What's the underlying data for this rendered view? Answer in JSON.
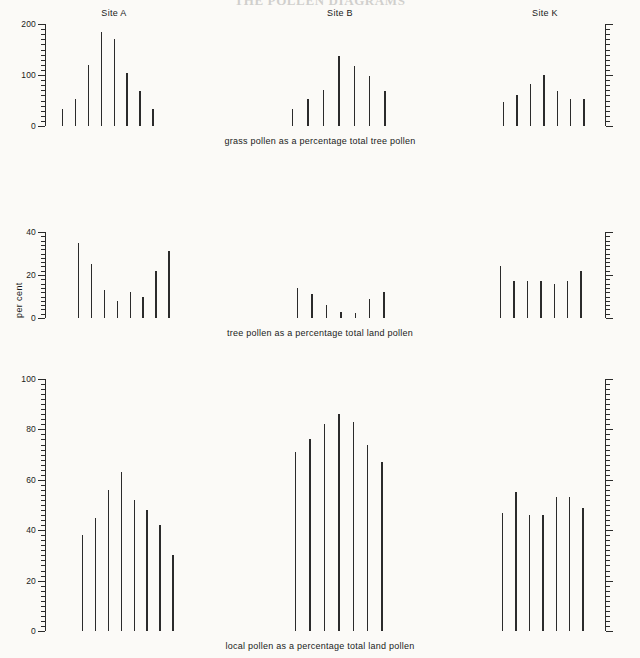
{
  "title": "THE POLLEN DIAGRAMS",
  "sites": [
    "Site A",
    "Site B",
    "Site K"
  ],
  "y_axis_label": "per cent",
  "captions": {
    "row1": "grass pollen as a percentage total tree pollen",
    "row2": "tree pollen as a percentage total land pollen",
    "row3": "local pollen as a percentage total land pollen"
  },
  "colors": {
    "background": "#fbfaf7",
    "ink": "#2b2b2b",
    "text": "#1a1a1a"
  },
  "chart_data": [
    {
      "type": "bar",
      "title": "grass pollen as a percentage total tree pollen",
      "xlabel": "",
      "ylabel": "",
      "ylim": [
        0,
        200
      ],
      "yticks": [
        0,
        100,
        200
      ],
      "ytick_labels": [
        "0",
        "100",
        "200"
      ],
      "minor_tick_step": 10,
      "grid": false,
      "legend": "none",
      "groups": [
        {
          "name": "Site A",
          "values": [
            33,
            53,
            120,
            185,
            170,
            103,
            68,
            33
          ]
        },
        {
          "name": "Site B",
          "values": [
            33,
            52,
            70,
            138,
            118,
            99,
            68
          ]
        },
        {
          "name": "Site K",
          "values": [
            48,
            60,
            83,
            100,
            68,
            52,
            53
          ]
        }
      ]
    },
    {
      "type": "bar",
      "title": "tree pollen as a percentage total land pollen",
      "xlabel": "",
      "ylabel": "per cent",
      "ylim": [
        0,
        40
      ],
      "yticks": [
        0,
        20,
        40
      ],
      "ytick_labels": [
        "0",
        "20",
        "40"
      ],
      "minor_tick_step": 2,
      "grid": false,
      "legend": "none",
      "groups": [
        {
          "name": "Site A",
          "values": [
            35,
            25,
            13,
            8,
            12,
            10,
            22,
            31
          ]
        },
        {
          "name": "Site B",
          "values": [
            14,
            11,
            6,
            3,
            2.5,
            9,
            12
          ]
        },
        {
          "name": "Site K",
          "values": [
            24,
            17,
            17,
            17,
            16,
            17,
            22
          ]
        }
      ]
    },
    {
      "type": "bar",
      "title": "local pollen as a percentage total land pollen",
      "xlabel": "",
      "ylabel": "",
      "ylim": [
        0,
        100
      ],
      "yticks": [
        0,
        20,
        40,
        60,
        80,
        100
      ],
      "ytick_labels": [
        "0",
        "20",
        "40",
        "60",
        "80",
        "100"
      ],
      "minor_tick_step": 2,
      "grid": false,
      "legend": "none",
      "groups": [
        {
          "name": "Site A",
          "values": [
            38,
            45,
            56,
            63,
            52,
            48,
            42,
            30
          ]
        },
        {
          "name": "Site B",
          "values": [
            71,
            76,
            82,
            86,
            83,
            74,
            67
          ]
        },
        {
          "name": "Site K",
          "values": [
            47,
            55,
            46,
            46,
            53,
            53,
            49
          ]
        }
      ]
    }
  ]
}
